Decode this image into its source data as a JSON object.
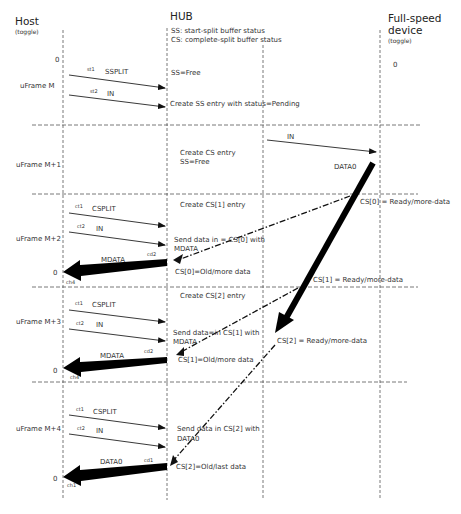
{
  "columns": {
    "host": {
      "title": "Host",
      "subtitle": "(toggle)"
    },
    "hub": {
      "title": "HUB",
      "legend": [
        "SS: start-split buffer status",
        "CS: complete-split buffer status"
      ]
    },
    "device": {
      "title_line1": "Full-speed",
      "title_line2": "device",
      "subtitle": "(toggle)",
      "initial_toggle": "0"
    }
  },
  "host_initial_toggle": "0",
  "frames": [
    {
      "label": "uFrame M"
    },
    {
      "label": "uFrame M+1"
    },
    {
      "label": "uFrame M+2"
    },
    {
      "label": "uFrame M+3"
    },
    {
      "label": "uFrame M+4"
    }
  ],
  "host_toggles": [
    "0",
    "0",
    "0"
  ],
  "messages": {
    "m_sst1": {
      "tag": "st1",
      "label": "SSPLIT"
    },
    "m_sst2": {
      "tag": "st2",
      "label": "IN"
    },
    "m1_in": {
      "label": "IN"
    },
    "m1_data0": {
      "label": "DATA0"
    },
    "m2_ct1": {
      "tag": "ct1",
      "label": "CSPLIT"
    },
    "m2_ct2": {
      "tag": "ct2",
      "label": "IN"
    },
    "m2_data": {
      "tag": "cd2",
      "label": "MDATA",
      "host_tag": "ch4"
    },
    "m3_ct1": {
      "tag": "ct1",
      "label": "CSPLIT"
    },
    "m3_ct2": {
      "tag": "ct2",
      "label": "IN"
    },
    "m3_data": {
      "tag": "cd2",
      "label": "MDATA",
      "host_tag": "ch4"
    },
    "m4_ct1": {
      "tag": "ct1",
      "label": "CSPLIT"
    },
    "m4_ct2": {
      "tag": "ct2",
      "label": "IN"
    },
    "m4_data": {
      "tag": "cd1",
      "label": "DATA0",
      "host_tag": "ch1"
    }
  },
  "hub_notes": {
    "ss_free": "SS=Free",
    "create_ss": "Create SS entry with status=Pending",
    "create_cs_1": "Create CS entry",
    "create_cs_2": "SS=Free",
    "create_cs1": "Create CS[1] entry",
    "send_cs0_1": "Send data in = CS[0] with",
    "send_cs0_2": "MDATA",
    "cs0_old": "CS[0]=Old/more data",
    "create_cs2": "Create CS[2] entry",
    "send_cs1_1": "Send data=in CS[1] with",
    "send_cs1_2": "MDATA",
    "cs1_old": "CS[1]=Old/more data",
    "send_cs2_1": "Send data in CS[2] with",
    "send_cs2_2": "DATA0",
    "cs2_old": "CS[2]=Old/last data"
  },
  "cs_status": {
    "cs0_ready": "CS[0] = Ready/more-data",
    "cs1_ready": "CS[1] = Ready/more-data",
    "cs2_ready": "CS[2] = Ready/more-data"
  }
}
